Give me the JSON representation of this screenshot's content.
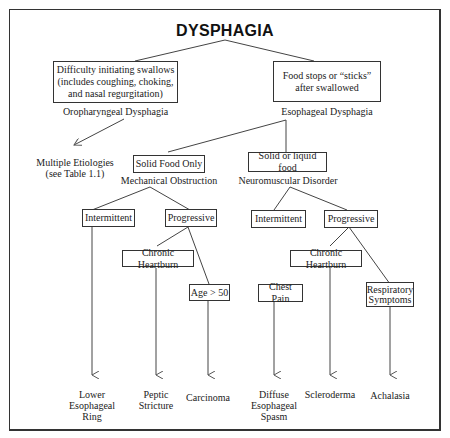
{
  "title": "DYSPHAGIA",
  "level1": {
    "oropharyngeal": {
      "box_lines": [
        "Difficulty initiating swallows",
        "(includes coughing, choking,",
        "and nasal regurgitation)"
      ],
      "label": "Oropharyngeal Dysphagia",
      "outcome_lines": [
        "Multiple Etiologies",
        "(see Table 1.1)"
      ]
    },
    "esophageal": {
      "box_lines": [
        "Food stops or “sticks”",
        "after swallowed"
      ],
      "label": "Esophageal Dysphagia"
    }
  },
  "level2": {
    "mechanical": {
      "box": "Solid Food Only",
      "label": "Mechanical Obstruction"
    },
    "neuromuscular": {
      "box": "Solid or liquid food",
      "label": "Neuromuscular Disorder"
    }
  },
  "level3": {
    "mech_intermittent": "Intermittent",
    "mech_progressive": "Progressive",
    "neuro_intermittent": "Intermittent",
    "neuro_progressive": "Progressive"
  },
  "level4": {
    "mech_heartburn": "Chronic Heartburn",
    "mech_age": "Age > 50",
    "neuro_chestpain": "Chest Pain",
    "neuro_heartburn": "Chronic Heartburn",
    "neuro_respiratory_lines": [
      "Respiratory",
      "Symptoms"
    ]
  },
  "outcomes": {
    "lower_ring": [
      "Lower",
      "Esophageal",
      "Ring"
    ],
    "peptic": [
      "Peptic",
      "Stricture"
    ],
    "carcinoma": [
      "Carcinoma"
    ],
    "diffuse_spasm": [
      "Diffuse",
      "Esophageal",
      "Spasm"
    ],
    "scleroderma": [
      "Scleroderma"
    ],
    "achalasia": [
      "Achalasia"
    ]
  }
}
